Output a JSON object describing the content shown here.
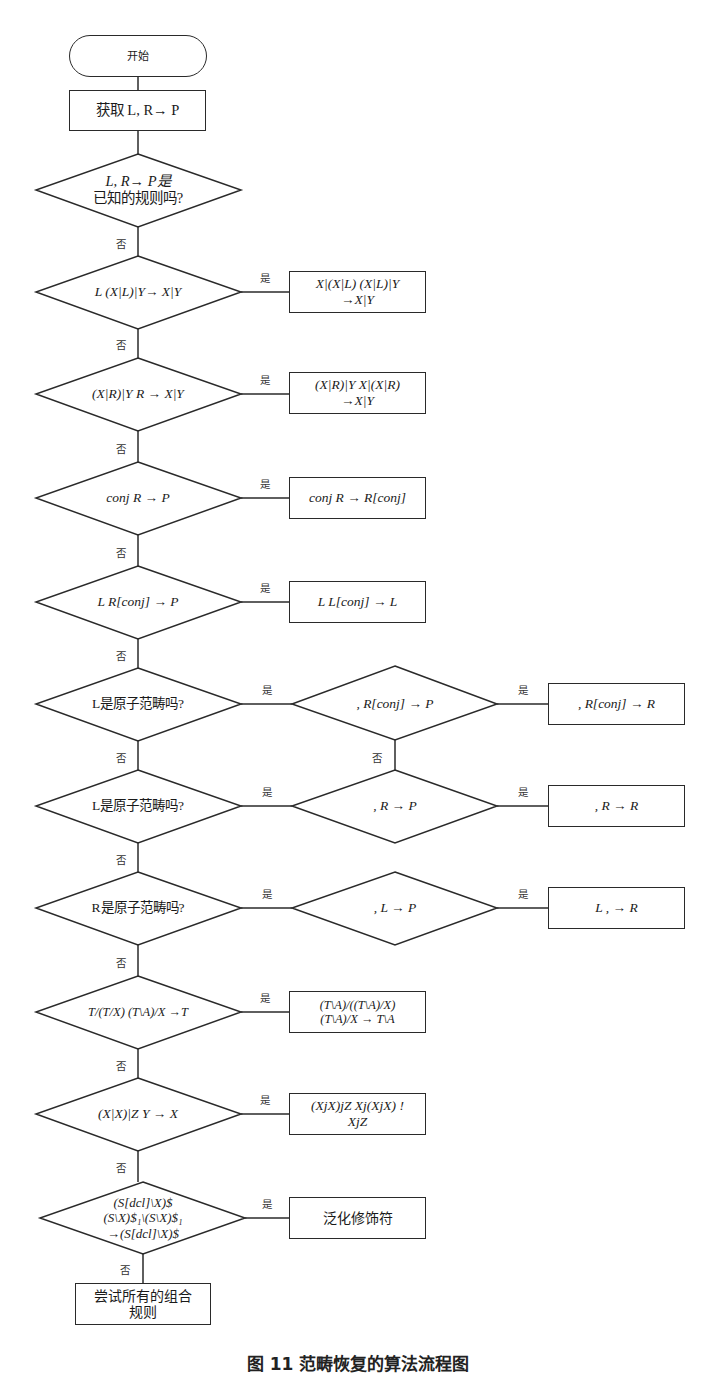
{
  "start": {
    "label": "开始"
  },
  "get_rule": {
    "label": "获取 L, R→ P"
  },
  "d_known": {
    "line1": "L, R→ P是",
    "line2": "已知的规则吗?"
  },
  "d1": {
    "label": "L (X|L)|Y→ X|Y",
    "result_line1": "X|(X|L) (X|L)|Y",
    "result_line2": "→X|Y"
  },
  "d2": {
    "label": "(X|R)|Y R → X|Y",
    "result_line1": "(X|R)|Y X|(X|R)",
    "result_line2": "→X|Y"
  },
  "d3": {
    "label": "conj R → P",
    "result": "conj R → R[conj]"
  },
  "d4": {
    "label": "L R[conj] → P",
    "result": "L L[conj] → L"
  },
  "d5": {
    "label": "L是原子范畴吗?",
    "sub_label": ", R[conj] → P",
    "result": ",  R[conj] → R"
  },
  "d6": {
    "label": "L是原子范畴吗?",
    "sub_label": ", R → P",
    "result": ",  R → R"
  },
  "d7": {
    "label": "R是原子范畴吗?",
    "sub_label": ", L → P",
    "result": "L ,  → R"
  },
  "d8": {
    "label": "T/(T/X) (T\\A)/X →T",
    "result_line1": "(T\\A)/((T\\A)/X)",
    "result_line2": "(T\\A)/X → T\\A"
  },
  "d9": {
    "label": "(X|X)|Z Y → X",
    "result_line1": "(XjX)jZ Xj(XjX) !",
    "result_line2": "XjZ"
  },
  "d10": {
    "line1": "(S[dcl]\\X)$",
    "line2": "(S\\X)$₁\\(S\\X)$₁",
    "line3": "→(S[dcl]\\X)$",
    "result": "泛化修饰符"
  },
  "final": {
    "line1": "尝试所有的组合",
    "line2": "规则"
  },
  "edge_labels": {
    "yes": "是",
    "no": "否"
  },
  "caption": "图 11  范畴恢复的算法流程图"
}
